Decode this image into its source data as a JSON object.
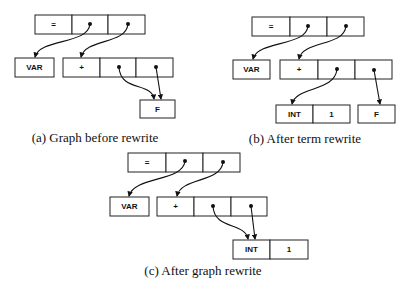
{
  "figure": {
    "panels": [
      {
        "id": "a",
        "caption": "(a) Graph before rewrite",
        "nodes": {
          "eq": {
            "label": "="
          },
          "var": {
            "label": "VAR"
          },
          "plus": {
            "label": "+"
          },
          "f": {
            "label": "F"
          }
        }
      },
      {
        "id": "b",
        "caption": "(b) After term rewrite",
        "nodes": {
          "eq": {
            "label": "="
          },
          "var": {
            "label": "VAR"
          },
          "plus": {
            "label": "+"
          },
          "int": {
            "label": "INT"
          },
          "one": {
            "label": "1"
          },
          "f": {
            "label": "F"
          }
        }
      },
      {
        "id": "c",
        "caption": "(c) After graph rewrite",
        "nodes": {
          "eq": {
            "label": "="
          },
          "var": {
            "label": "VAR"
          },
          "plus": {
            "label": "+"
          },
          "int": {
            "label": "INT"
          },
          "one": {
            "label": "1"
          }
        }
      }
    ]
  }
}
